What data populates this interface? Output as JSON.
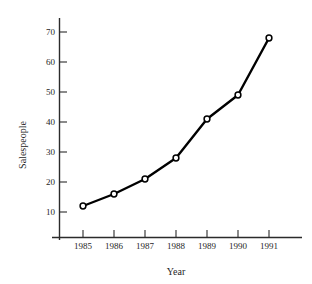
{
  "chart_data": {
    "type": "line",
    "title": "",
    "subtitle": "",
    "xlabel": "Year",
    "ylabel": "Salespeople",
    "categories": [
      "1985",
      "1986",
      "1987",
      "1988",
      "1989",
      "1990",
      "1991"
    ],
    "x": [
      1985,
      1986,
      1987,
      1988,
      1989,
      1990,
      1991
    ],
    "values": [
      12,
      16,
      21,
      28,
      41,
      49,
      68
    ],
    "series": [
      {
        "name": "Salespeople",
        "values": [
          12,
          16,
          21,
          28,
          41,
          49,
          68
        ]
      }
    ],
    "xlim": [
      1984.5,
      1991.6
    ],
    "ylim": [
      0,
      74
    ],
    "ytick_labels": [
      "10",
      "20",
      "30",
      "40",
      "50",
      "60",
      "70"
    ],
    "yticks": [
      10,
      20,
      30,
      40,
      50,
      60,
      70
    ],
    "xtick_labels": [
      "1985",
      "1986",
      "1987",
      "1988",
      "1989",
      "1990",
      "1991"
    ],
    "grid": false,
    "legend": false,
    "legend_position": "none",
    "marker": "open-circle",
    "line_color": "#000000",
    "marker_fill": "#ffffff",
    "axis_color": "#2b2b2b",
    "background": "#ffffff"
  },
  "axes": {
    "y_title": "Salespeople",
    "x_title": "Year"
  }
}
